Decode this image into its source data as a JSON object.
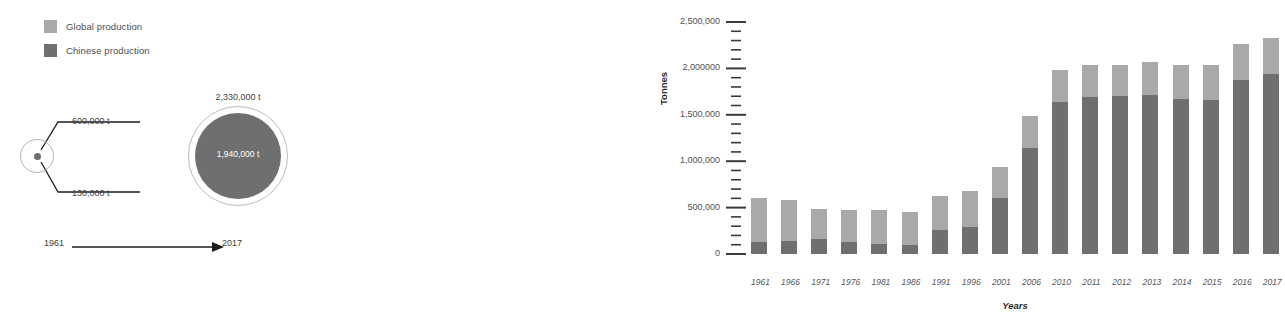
{
  "legend": {
    "items": [
      {
        "label": "Global production",
        "color": "#a9a9a9",
        "swatch_name": "legend-swatch-global"
      },
      {
        "label": "Chinese production",
        "color": "#6f6f6f",
        "swatch_name": "legend-swatch-chinese"
      }
    ]
  },
  "diagram": {
    "start_year": "1961",
    "end_year": "2017",
    "small_outer_label": "600,000 t",
    "small_inner_label": "130,000 t",
    "big_outer_label": "2,330,000 t",
    "big_inner_label": "1,940,000 t",
    "outer_ring_color": "#bdbdbd",
    "inner_fill_color": "#6f6f6f"
  },
  "chart_data": {
    "type": "bar",
    "stacked": true,
    "title": "",
    "xlabel": "Years",
    "ylabel": "Tonnes",
    "grid": false,
    "legend_position": "top-left",
    "ylim": [
      0,
      2500000
    ],
    "ytick_labels": [
      "2,500,000",
      "2,000000",
      "1,500,000",
      "1,000,000",
      "500,000",
      "0"
    ],
    "ytick_values": [
      2500000,
      2000000,
      1500000,
      1000000,
      500000,
      0
    ],
    "minor_tick_step": 100000,
    "categories": [
      "1961",
      "1966",
      "1971",
      "1976",
      "1981",
      "1986",
      "1991",
      "1996",
      "2001",
      "2006",
      "2010",
      "2011",
      "2012",
      "2013",
      "2014",
      "2015",
      "2016",
      "2017"
    ],
    "series": [
      {
        "name": "Chinese production",
        "color": "#6f6f6f",
        "values": [
          130000,
          140000,
          160000,
          130000,
          110000,
          100000,
          260000,
          290000,
          600000,
          1140000,
          1640000,
          1690000,
          1700000,
          1710000,
          1670000,
          1660000,
          1870000,
          1940000
        ]
      },
      {
        "name": "Global production",
        "color": "#a9a9a9",
        "values": [
          600000,
          580000,
          490000,
          470000,
          470000,
          450000,
          630000,
          680000,
          940000,
          1490000,
          1980000,
          2040000,
          2040000,
          2070000,
          2040000,
          2040000,
          2260000,
          2330000
        ]
      }
    ]
  }
}
